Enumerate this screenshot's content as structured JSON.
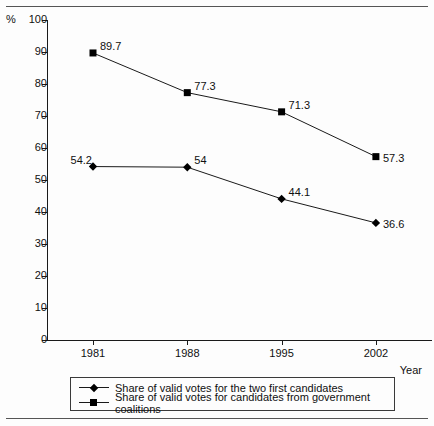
{
  "chart_data": {
    "type": "line",
    "title": "",
    "xlabel": "Year",
    "ylabel": "%",
    "categories": [
      "1981",
      "1988",
      "1995",
      "2002"
    ],
    "x": [
      1981,
      1988,
      1995,
      2002
    ],
    "ylim": [
      0,
      100
    ],
    "y_ticks": [
      0,
      10,
      20,
      30,
      40,
      50,
      60,
      70,
      80,
      90,
      100
    ],
    "grid": false,
    "legend_position": "bottom",
    "series": [
      {
        "name": "Share of valid votes for the two first candidates",
        "marker": "diamond",
        "values": [
          54.2,
          54,
          44.1,
          36.6
        ],
        "labels": [
          "54.2",
          "54",
          "44.1",
          "36.6"
        ]
      },
      {
        "name": "Share of valid votes for candidates from government coalitions",
        "marker": "square",
        "values": [
          89.7,
          77.3,
          71.3,
          57.3
        ],
        "labels": [
          "89.7",
          "77.3",
          "71.3",
          "57.3"
        ]
      }
    ]
  },
  "axis": {
    "percent_symbol": "%",
    "x_title": "Year",
    "y_tick_labels": [
      "100",
      "90",
      "80",
      "70",
      "60",
      "50",
      "40",
      "30",
      "20",
      "10",
      "0"
    ],
    "x_tick_labels": [
      "1981",
      "1988",
      "1995",
      "2002"
    ]
  },
  "legend": {
    "items": [
      {
        "marker": "diamond",
        "label": "Share of valid votes for the two first candidates"
      },
      {
        "marker": "square",
        "label": "Share of valid votes for candidates from government coalitions"
      }
    ]
  },
  "colors": {
    "line": "#1a1a1a",
    "marker": "#000000",
    "rule": "#555555",
    "background": "#fdfdfd"
  }
}
